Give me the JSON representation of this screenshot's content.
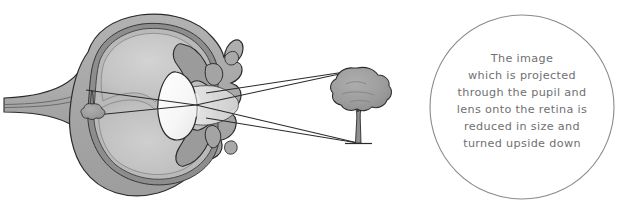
{
  "figure": {
    "background_color": "#ffffff"
  },
  "eye_diagram": {
    "name": "eye-cross-section",
    "parts": [
      {
        "id": "sclera",
        "label": "Sclera",
        "color": "#a8a8a8"
      },
      {
        "id": "choroid",
        "label": "Choroid",
        "color": "#8d8d8d"
      },
      {
        "id": "retina",
        "label": "Retina",
        "color": "#b9b9b9"
      },
      {
        "id": "vitreous",
        "label": "Vitreous body",
        "color": "#c4c4c4"
      },
      {
        "id": "aqueous",
        "label": "Aqueous humour",
        "color": "#d8d8d8"
      },
      {
        "id": "lens",
        "label": "Lens",
        "color": "#fbfbfb"
      },
      {
        "id": "iris",
        "label": "Iris",
        "color": "#9b9b9b"
      },
      {
        "id": "cornea",
        "label": "Cornea",
        "color": "#e3e3e3"
      },
      {
        "id": "optic-nerve",
        "label": "Optic nerve",
        "color": "#b0b0b0"
      },
      {
        "id": "pupil",
        "label": "Pupil",
        "color": "#ffffff"
      }
    ],
    "outline_color": "#2b2b2b",
    "ray_color": "#2b2b2b"
  },
  "object_tree": {
    "name": "tree-object",
    "canopy_color": "#9d9d9d",
    "trunk_color": "#8f8f8f",
    "outline_color": "#2b2b2b",
    "orientation": "upright"
  },
  "retinal_image": {
    "name": "inverted-tree-image",
    "canopy_color": "#9d9d9d",
    "trunk_color": "#8f8f8f",
    "outline_color": "#2b2b2b",
    "orientation": "inverted"
  },
  "light_rays": {
    "name": "light-rays",
    "count": 2,
    "description": "Rays from top and bottom of tree crossing at the lens"
  },
  "caption": {
    "name": "caption-bubble",
    "shape": "circle",
    "border_color": "#8a8a8a",
    "text_color": "#6f6f72",
    "lines": [
      "The image",
      "which is projected",
      "through the pupil and",
      "lens onto the retina is",
      "reduced in size and",
      "turned upside down"
    ]
  }
}
